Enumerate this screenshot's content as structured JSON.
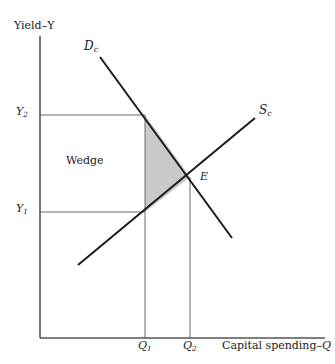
{
  "figure": {
    "type": "economics-supply-demand-diagram",
    "background_color": "#ffffff",
    "line_color": "#1a1a1a",
    "guide_line_color": "#6b6b6b",
    "shade_color": "#c9c9c9"
  },
  "axes": {
    "y_axis_label": "Yield–Y",
    "x_axis_label_prefix": "Capital spending–",
    "x_axis_label_symbol": "Q",
    "x_axis_label_full": "Capital spending–Q",
    "origin_px": [
      40,
      338
    ],
    "x_axis_end_px": [
      325,
      338
    ],
    "y_axis_top_px": [
      40,
      36
    ]
  },
  "ticks": {
    "y": [
      {
        "label_base": "Y",
        "label_sub": "2",
        "label": "Y2",
        "y_px": 115
      },
      {
        "label_base": "Y",
        "label_sub": "1",
        "label": "Y1",
        "y_px": 212
      }
    ],
    "x": [
      {
        "label_base": "Q",
        "label_sub": "1",
        "label": "Q1",
        "x_px": 145
      },
      {
        "label_base": "Q",
        "label_sub": "2",
        "label": "Q2",
        "x_px": 190
      }
    ]
  },
  "curves": [
    {
      "name": "demand",
      "label_base": "D",
      "label_sub": "c",
      "label": "Dc",
      "slope": "downward",
      "start_px": [
        100,
        57
      ],
      "end_px": [
        232,
        238
      ]
    },
    {
      "name": "supply",
      "label_base": "S",
      "label_sub": "c",
      "label": "Sc",
      "slope": "upward",
      "start_px": [
        78,
        265
      ],
      "end_px": [
        255,
        118
      ]
    }
  ],
  "points": [
    {
      "name": "equilibrium",
      "label": "E",
      "x_px": 190,
      "y_px": 177
    }
  ],
  "regions": [
    {
      "name": "wedge-rectangle",
      "label": "Wedge",
      "x0_px": 40,
      "x1_px": 145,
      "y_top_px": 115,
      "y_bottom_px": 212,
      "filled": false
    },
    {
      "name": "deadweight-triangle",
      "label": "",
      "vertices_px": [
        [
          145,
          115
        ],
        [
          145,
          212
        ],
        [
          190,
          177
        ]
      ],
      "filled": true
    }
  ]
}
